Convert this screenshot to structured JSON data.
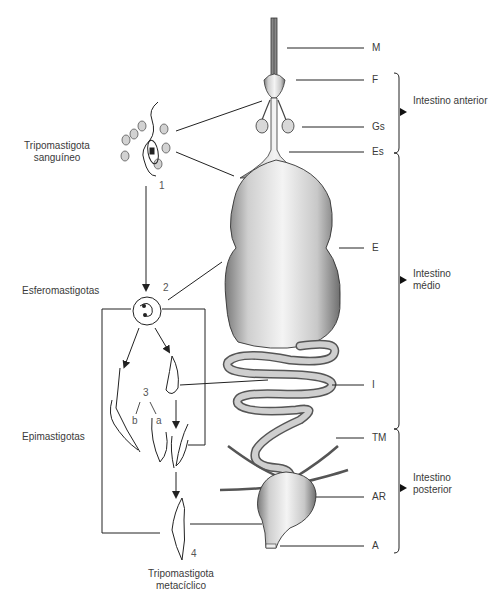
{
  "diagram": {
    "title": "",
    "stages": [
      {
        "id": "1",
        "label_line1": "Tripomastigota",
        "label_line2": "sanguíneo"
      },
      {
        "id": "2",
        "label_line1": "Esferomastigotas",
        "label_line2": ""
      },
      {
        "id": "3",
        "label_line1": "Epimastigotas",
        "label_line2": "",
        "sub_a": "a",
        "sub_b": "b"
      },
      {
        "id": "4",
        "label_line1": "Tripomastigota",
        "label_line2": "metacíclico"
      }
    ],
    "anatomy_labels": [
      {
        "key": "M"
      },
      {
        "key": "F"
      },
      {
        "key": "Gs"
      },
      {
        "key": "Es"
      },
      {
        "key": "E"
      },
      {
        "key": "I"
      },
      {
        "key": "TM"
      },
      {
        "key": "AR"
      },
      {
        "key": "A"
      }
    ],
    "regions": [
      {
        "label_line1": "Intestino anterior",
        "label_line2": ""
      },
      {
        "label_line1": "Intestino",
        "label_line2": "médio"
      },
      {
        "label_line1": "Intestino",
        "label_line2": "posterior"
      }
    ],
    "colors": {
      "line": "#2a2a2a",
      "text": "#3a3a3a",
      "organ_fill": "#e9e9e9",
      "organ_shade": "#9a9a9a"
    }
  }
}
